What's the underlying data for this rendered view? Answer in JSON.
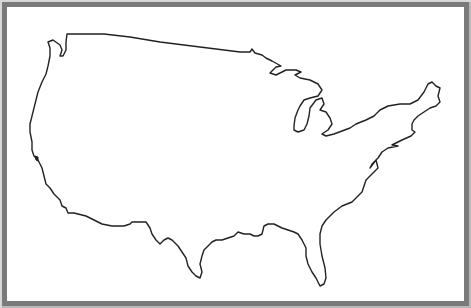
{
  "figure": {
    "outline_color": "#222222",
    "background_color": "#ffffff",
    "frame_color": "#7a7a7a"
  }
}
